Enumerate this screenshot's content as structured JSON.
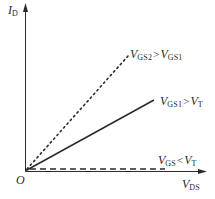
{
  "axes": {
    "y_label": {
      "main": "I",
      "sub": "D"
    },
    "x_label": {
      "main": "V",
      "sub": "DS"
    },
    "origin_label": "O"
  },
  "curves": [
    {
      "id": "vgs2",
      "style": "dotted",
      "label": {
        "lhs_main": "V",
        "lhs_sub": "GS2",
        "op": ">",
        "rhs_main": "V",
        "rhs_sub": "GS1"
      }
    },
    {
      "id": "vgs1",
      "style": "solid",
      "label": {
        "lhs_main": "V",
        "lhs_sub": "GS1",
        "op": ">",
        "rhs_main": "V",
        "rhs_sub": "T"
      }
    },
    {
      "id": "vgs_below_threshold",
      "style": "dashed",
      "label": {
        "lhs_main": "V",
        "lhs_sub": "GS",
        "op": "<",
        "rhs_main": "V",
        "rhs_sub": "T"
      }
    }
  ],
  "colors": {
    "line": "#2a2a2a",
    "background": "#ffffff"
  }
}
